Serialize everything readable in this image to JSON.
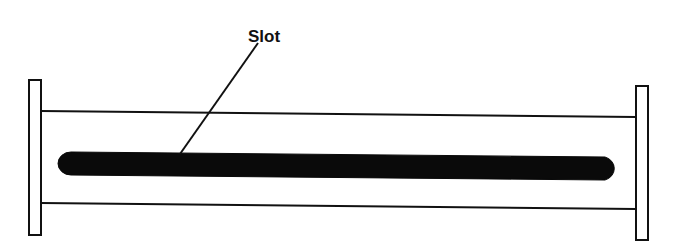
{
  "diagram": {
    "type": "slotted waveguide",
    "labels": {
      "slot": "Slot"
    },
    "components": [
      {
        "name": "left-flange",
        "shape": "rectangle"
      },
      {
        "name": "waveguide-body",
        "shape": "two parallel lines"
      },
      {
        "name": "slot",
        "shape": "rounded bar (filled)"
      },
      {
        "name": "right-flange",
        "shape": "rectangle"
      },
      {
        "name": "slot-leader-line",
        "shape": "line from label to slot"
      }
    ],
    "colors": {
      "stroke": "#111111",
      "fill": "#0a0a0a",
      "background": "#ffffff"
    }
  }
}
